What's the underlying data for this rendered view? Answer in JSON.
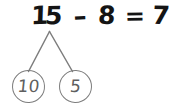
{
  "worksheet": {
    "title": "subtraction-with-number-bond",
    "ink_color": "#141414",
    "bond_color": "#7d7d7d",
    "background": "#ffffff"
  },
  "equation": {
    "minuend_tens_digit": "1",
    "minuend_ones_digit": "5",
    "minuend": "15",
    "operator": "–",
    "subtrahend": "8",
    "equals": "=",
    "result": "7",
    "full_text": "15 – 8 = 7"
  },
  "number_bond": {
    "whole": "15",
    "parts": [
      {
        "label": "10",
        "name": "left-part"
      },
      {
        "label": "5",
        "name": "right-part"
      }
    ],
    "apex": {
      "x": 49,
      "y": 31
    },
    "left_branch_end": {
      "x": 28,
      "y": 71
    },
    "right_branch_end": {
      "x": 72,
      "y": 71
    }
  }
}
